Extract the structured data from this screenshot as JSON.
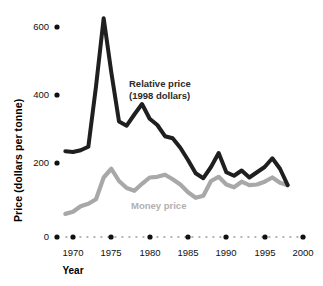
{
  "chart_data": {
    "type": "line",
    "title": "",
    "xlabel": "Year",
    "ylabel": "Price (dollars per tonne)",
    "xlim": [
      1968,
      2000
    ],
    "ylim": [
      0,
      650
    ],
    "grid": false,
    "legend_position": "inline-annotation",
    "y_ticks": [
      0,
      200,
      400,
      600
    ],
    "y_tick_labels": [
      "0",
      "200",
      "400",
      "600"
    ],
    "x_ticks": [
      1970,
      1975,
      1980,
      1985,
      1990,
      1995,
      2000
    ],
    "x_tick_labels": [
      "1970",
      "1975",
      "1980",
      "1985",
      "1990",
      "1995",
      "2000"
    ],
    "annotations": [
      {
        "text": "Relative price",
        "color": "#2b2b2b"
      },
      {
        "text": "(1998 dollars)",
        "color": "#2b2b2b"
      },
      {
        "text": "Money price",
        "color": "#b0b0b0"
      }
    ],
    "x": [
      1969,
      1970,
      1971,
      1972,
      1973,
      1974,
      1975,
      1976,
      1977,
      1978,
      1979,
      1980,
      1981,
      1982,
      1983,
      1984,
      1985,
      1986,
      1987,
      1988,
      1989,
      1990,
      1991,
      1992,
      1993,
      1994,
      1995,
      1996,
      1997,
      1998
    ],
    "series": [
      {
        "name": "Relative price (1998 dollars)",
        "color": "#1f1f1f",
        "values": [
          245,
          243,
          248,
          258,
          430,
          625,
          470,
          330,
          318,
          350,
          380,
          338,
          320,
          288,
          282,
          255,
          220,
          182,
          168,
          200,
          240,
          185,
          175,
          190,
          170,
          185,
          200,
          225,
          195,
          148
        ]
      },
      {
        "name": "Money price",
        "color": "#a8a8a8",
        "values": [
          66,
          72,
          88,
          95,
          108,
          170,
          195,
          160,
          140,
          132,
          152,
          170,
          172,
          178,
          165,
          150,
          128,
          112,
          118,
          160,
          172,
          150,
          142,
          158,
          148,
          150,
          158,
          170,
          155,
          148
        ]
      }
    ]
  },
  "axis_dots": {
    "marker_shape": "filled-circle",
    "x_axis_style": "dotted-line-with-year-markers"
  }
}
